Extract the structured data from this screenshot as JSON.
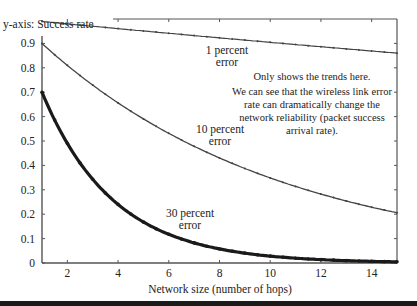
{
  "chart_data": {
    "type": "line",
    "title": "",
    "xlabel": "Network size (number of hops)",
    "ylabel": "y-axis: Success rate",
    "xlim": [
      1,
      15
    ],
    "ylim": [
      0,
      1
    ],
    "x_ticks": [
      2,
      4,
      6,
      8,
      10,
      12,
      14
    ],
    "y_ticks": [
      0,
      0.1,
      0.2,
      0.3,
      0.4,
      0.5,
      0.6,
      0.7,
      0.8,
      0.9
    ],
    "grid": false,
    "x": [
      1,
      2,
      3,
      4,
      5,
      6,
      7,
      8,
      9,
      10,
      11,
      12,
      13,
      14,
      15
    ],
    "series": [
      {
        "name": "1 percent error",
        "values": [
          0.99,
          0.98,
          0.97,
          0.96,
          0.95,
          0.94,
          0.93,
          0.92,
          0.91,
          0.9,
          0.9,
          0.89,
          0.88,
          0.87,
          0.86
        ]
      },
      {
        "name": "10 percent error",
        "values": [
          0.9,
          0.81,
          0.73,
          0.66,
          0.59,
          0.53,
          0.48,
          0.43,
          0.39,
          0.35,
          0.31,
          0.28,
          0.25,
          0.23,
          0.21
        ]
      },
      {
        "name": "30 percent error",
        "values": [
          0.7,
          0.49,
          0.34,
          0.24,
          0.17,
          0.12,
          0.08,
          0.06,
          0.04,
          0.03,
          0.02,
          0.01,
          0.01,
          0.01,
          0.0
        ]
      }
    ],
    "annotations": [
      {
        "text": "1 percent error",
        "near_series": "1 percent error"
      },
      {
        "text": "10 percent error",
        "near_series": "10 percent error"
      },
      {
        "text": "30 percent error",
        "near_series": "30 percent error"
      },
      {
        "text": "Only shows the trends here."
      },
      {
        "text": "We can see that the wireless link error rate can dramatically change the network reliability (packet success arrival rate)."
      }
    ]
  },
  "labels": {
    "ylabel": "y-axis: Success rate",
    "xlabel": "Network size (number of hops)",
    "s1a": "1 percent",
    "s1b": "error",
    "s2a": "10 percent",
    "s2b": "error",
    "s3a": "30 percent",
    "s3b": "error",
    "note1": "Only shows the trends here.",
    "note2a": "We can see that the wireless link error",
    "note2b": "rate can dramatically change the",
    "note2c": "network reliability (packet success",
    "note2d": "arrival rate)."
  },
  "colors": {
    "line": "#444444",
    "heavy": "#1a1a1a",
    "axis": "#555555"
  }
}
